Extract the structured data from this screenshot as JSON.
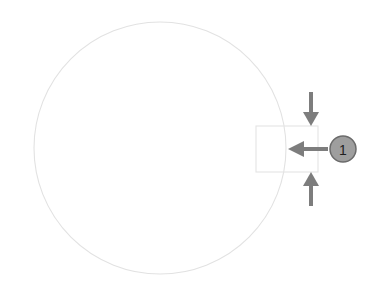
{
  "diagram": {
    "background_color": "#ffffff",
    "canvas": {
      "width": 386,
      "height": 290
    },
    "body_circle": {
      "name": "main-circle-outline",
      "center_x": 160,
      "center_y": 148,
      "radius": 126,
      "stroke_color": "#e2e2e2",
      "stroke_width": 1.1,
      "fill": "none"
    },
    "feature_rectangle": {
      "name": "rectangle-feature",
      "x": 256,
      "y": 126,
      "width": 62,
      "height": 46,
      "stroke_color": "#e4e4e4",
      "stroke_width": 1.1,
      "fill": "none"
    },
    "arrows": [
      {
        "id": "arrow-down",
        "direction": "down",
        "color": "#7d7d7d",
        "x": 311,
        "y_start": 92,
        "y_end": 126,
        "shaft_width": 4,
        "head_width": 16,
        "head_length": 14
      },
      {
        "id": "arrow-left",
        "direction": "left",
        "color": "#7d7d7d",
        "y": 149,
        "x_start": 328,
        "x_end": 288,
        "shaft_width": 4,
        "head_width": 16,
        "head_length": 16
      },
      {
        "id": "arrow-up",
        "direction": "up",
        "color": "#7d7d7d",
        "x": 311,
        "y_start": 206,
        "y_end": 172,
        "shaft_width": 4,
        "head_width": 16,
        "head_length": 14
      }
    ],
    "callout": {
      "id": "callout-1",
      "label": "1",
      "center_x": 343,
      "center_y": 149,
      "radius": 13,
      "fill_color": "#9e9e9e",
      "stroke_color": "#6b6b6b",
      "stroke_width": 1.5,
      "text_color": "#1f1f1f"
    }
  }
}
